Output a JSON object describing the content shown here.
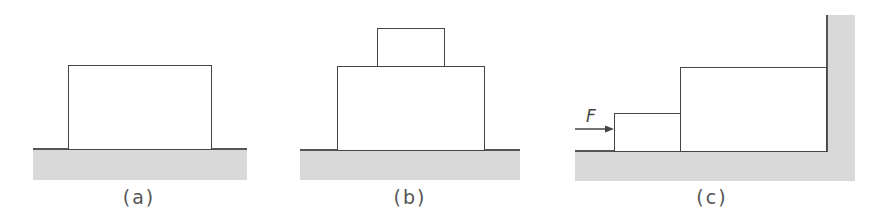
{
  "figures": [
    {
      "id": "a",
      "caption": "(a)",
      "description": "single block on ground"
    },
    {
      "id": "b",
      "caption": "(b)",
      "description": "small block stacked on larger block on ground"
    },
    {
      "id": "c",
      "caption": "(c)",
      "description": "force F pushes small block against larger block pressed to wall"
    }
  ],
  "force": {
    "label": "F"
  },
  "colors": {
    "ground": "#d9d9d9",
    "line": "#444444"
  }
}
